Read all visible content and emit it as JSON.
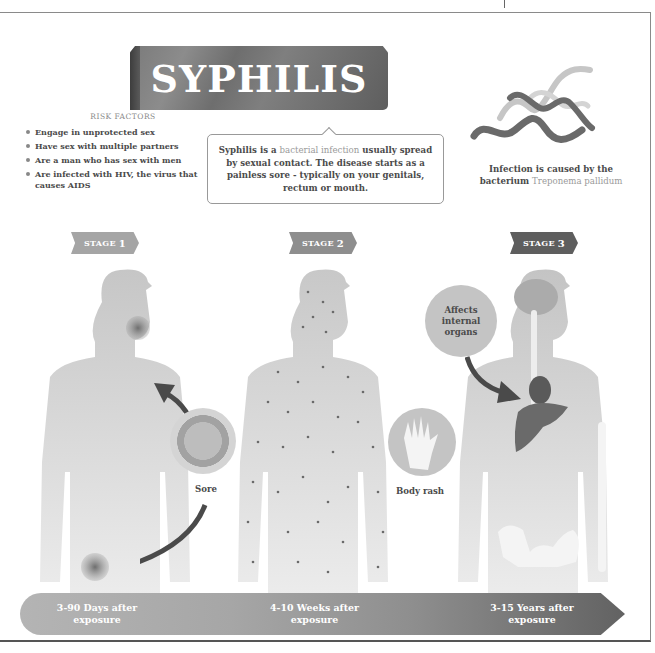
{
  "title": "SYPHILIS",
  "risk_factors": {
    "heading": "RISK FACTORS",
    "items": [
      "Engage in unprotected sex",
      "Have sex with multiple partners",
      "Are a man who has sex with men",
      "Are infected with HIV, the virus that causes AIDS"
    ]
  },
  "info": {
    "part1": "Syphilis is a ",
    "highlight": "bacterial infection",
    "part2": " usually spread by sexual contact. The disease starts as a painless sore - typically on your genitals, rectum or mouth."
  },
  "bacterium": {
    "caption_part1": "Infection is caused by the bacterium ",
    "caption_highlight": "Treponema pallidum"
  },
  "stages": [
    {
      "tag": "STAGE",
      "num": "1",
      "callout": "Sore",
      "timeline": "3-90 Days after exposure"
    },
    {
      "tag": "STAGE",
      "num": "2",
      "callout": "Body rash",
      "timeline": "4-10 Weeks after exposure"
    },
    {
      "tag": "STAGE",
      "num": "3",
      "callout": "Affects internal organs",
      "timeline": "3-15 Years after exposure"
    }
  ],
  "colors": {
    "banner": "#7a7a7a",
    "stage1": "#a5a5a5",
    "stage2": "#8e8e8e",
    "stage3": "#5e5e5e",
    "body_silhouette": "#c8c8c8",
    "lesion": "#7a7a7a",
    "arrow": "#4a4a4a"
  }
}
